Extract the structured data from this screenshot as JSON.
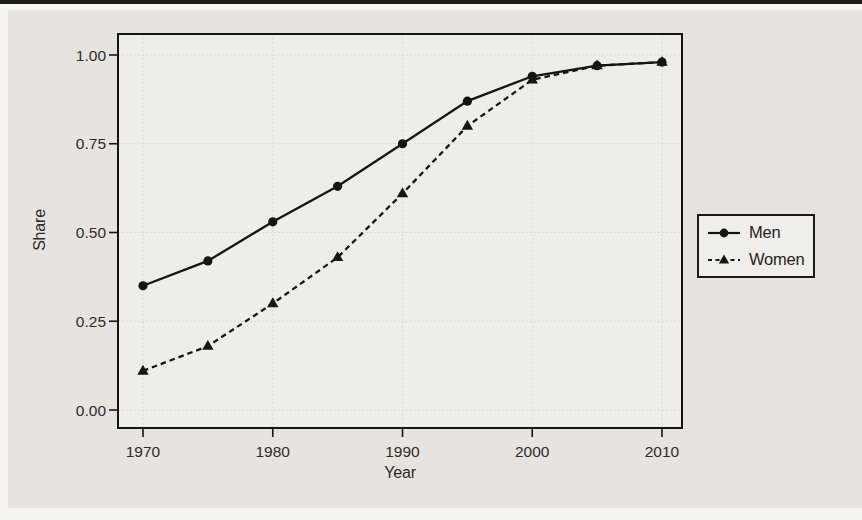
{
  "figure": {
    "panel": "scanned grayscale statistical figure",
    "ink_color": "#161514",
    "grid_color": "#d6d3cd",
    "plot_bg": "#efedea",
    "page_bg": "#e7e4e0"
  },
  "chart_data": {
    "type": "line",
    "title": "",
    "xlabel": "Year",
    "ylabel": "Share",
    "x": [
      1970,
      1975,
      1980,
      1985,
      1990,
      1995,
      2000,
      2005,
      2010
    ],
    "series": [
      {
        "name": "Men",
        "marker": "circle",
        "line_style": "solid",
        "values": [
          0.35,
          0.42,
          0.53,
          0.63,
          0.75,
          0.87,
          0.94,
          0.97,
          0.98
        ]
      },
      {
        "name": "Women",
        "marker": "triangle",
        "line_style": "dashed",
        "values": [
          0.11,
          0.18,
          0.3,
          0.43,
          0.61,
          0.8,
          0.93,
          0.97,
          0.98
        ]
      }
    ],
    "x_ticks": [
      1970,
      1980,
      1990,
      2000,
      2010
    ],
    "y_ticks": [
      {
        "value": 0.0,
        "label": "0.00"
      },
      {
        "value": 0.25,
        "label": "0.25"
      },
      {
        "value": 0.5,
        "label": "0.50"
      },
      {
        "value": 0.75,
        "label": "0.75"
      },
      {
        "value": 1.0,
        "label": "1.00"
      }
    ],
    "xlim": [
      1968.1,
      2011.6
    ],
    "ylim": [
      -0.051,
      1.109
    ],
    "grid": true,
    "legend_position": "outside-right"
  }
}
